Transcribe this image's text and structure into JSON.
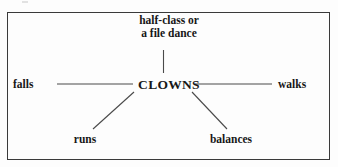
{
  "figure": {
    "type": "word-web-diagram",
    "background_color": "#fdfdfd",
    "border_color": "#3a3a3a",
    "text_color": "#171717",
    "line_color": "#4a4a4a"
  },
  "diagram": {
    "center_node": {
      "label": "CLOWNS"
    },
    "branches": [
      {
        "id": "top",
        "label_line1": "half-class or",
        "label_line2": "a file dance",
        "connector": "vertical"
      },
      {
        "id": "left",
        "label": "falls",
        "connector": "horizontal"
      },
      {
        "id": "right",
        "label": "walks",
        "connector": "horizontal"
      },
      {
        "id": "bottom-left",
        "label": "runs",
        "connector": "diagonal"
      },
      {
        "id": "bottom-right",
        "label": "balances",
        "connector": "diagonal"
      }
    ]
  }
}
